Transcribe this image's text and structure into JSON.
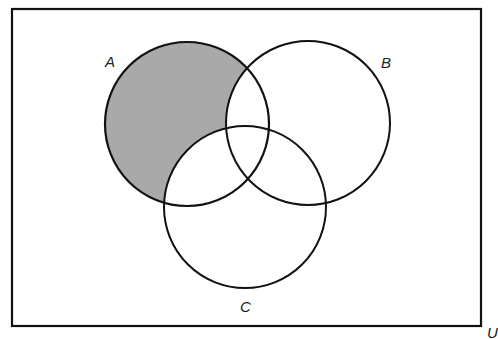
{
  "diagram": {
    "type": "venn",
    "universe_label": "U",
    "sets": [
      {
        "label": "A",
        "cx": 187,
        "cy": 124,
        "r": 82
      },
      {
        "label": "B",
        "cx": 308,
        "cy": 123,
        "r": 82
      },
      {
        "label": "C",
        "cx": 245,
        "cy": 207,
        "r": 81
      }
    ],
    "shaded_region": "A only (A minus B minus C)",
    "colors": {
      "stroke": "#111111",
      "shade": "#a9a9a9",
      "background": "#ffffff"
    }
  }
}
